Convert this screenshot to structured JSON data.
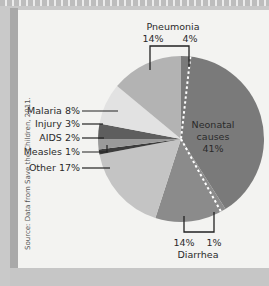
{
  "chart_data": {
    "type": "pie",
    "title": "",
    "source": "Source: Data from Save the Children, 2011.",
    "slices": [
      {
        "label": "Neonatal causes",
        "value": 41,
        "color": "#7a7a7a",
        "group": "Neonatal"
      },
      {
        "label": "Diarrhea",
        "value": 14,
        "color": "#8b8b8b",
        "group": "Diarrhea"
      },
      {
        "label": "Other",
        "value": 17,
        "color": "#c4c4c4",
        "group": "Other"
      },
      {
        "label": "Measles",
        "value": 1,
        "color": "#3c3c3c",
        "group": "Measles"
      },
      {
        "label": "AIDS",
        "value": 2,
        "color": "#9a9a9a",
        "group": "AIDS"
      },
      {
        "label": "Injury",
        "value": 3,
        "color": "#5e5e5e",
        "group": "Injury"
      },
      {
        "label": "Malaria",
        "value": 8,
        "color": "#e2e2e2",
        "group": "Malaria"
      },
      {
        "label": "Pneumonia",
        "value": 14,
        "color": "#b3b3b3",
        "group": "Pneumonia"
      }
    ],
    "overlap_note": "Dashed line separates neonatal share: Pneumonia 4% and Diarrhea 1% occur in neonatal period",
    "labels": {
      "neonatal": [
        "Neonatal",
        "causes",
        "41%"
      ],
      "pneumonia_title": "Pneumonia",
      "pneumonia_left": "14%",
      "pneumonia_right": "4%",
      "diarrhea_title": "Diarrhea",
      "diarrhea_left": "14%",
      "diarrhea_right": "1%",
      "malaria": "Malaria 8%",
      "injury": "Injury 3%",
      "aids": "AIDS 2%",
      "measles": "Measles 1%",
      "other": "Other 17%"
    }
  }
}
